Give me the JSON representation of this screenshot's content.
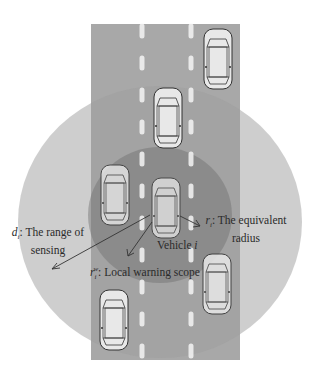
{
  "diagram": {
    "colors": {
      "background": "#ffffff",
      "road": "#a8a8a8",
      "outer_region": "#bdbdbd",
      "inner_region": "#8c8c8c",
      "lane_marking": "#f4f4f4",
      "car_body": "#e8e8e8",
      "car_outline": "#333333",
      "arrow": "#333333"
    },
    "labels": {
      "sensing_symbol": "d",
      "sensing_sub": "i",
      "sensing_line1": ": The range of",
      "sensing_line2": "sensing",
      "equiv_symbol": "r",
      "equiv_sub": "i",
      "equiv_line1": ": The equivalent",
      "equiv_line2": "radius",
      "vehicle_text": "Vehicle ",
      "vehicle_index": "i",
      "local_symbol": "r",
      "local_sub": "i",
      "local_sup": "w",
      "local_text": ": Local warning scope"
    },
    "vehicles": [
      {
        "id": "top-right",
        "lane": 3
      },
      {
        "id": "upper-middle",
        "lane": 2
      },
      {
        "id": "left",
        "lane": 1
      },
      {
        "id": "vehicle-i",
        "lane": 2
      },
      {
        "id": "lower-right",
        "lane": 3
      },
      {
        "id": "bottom-left",
        "lane": 1
      }
    ]
  }
}
